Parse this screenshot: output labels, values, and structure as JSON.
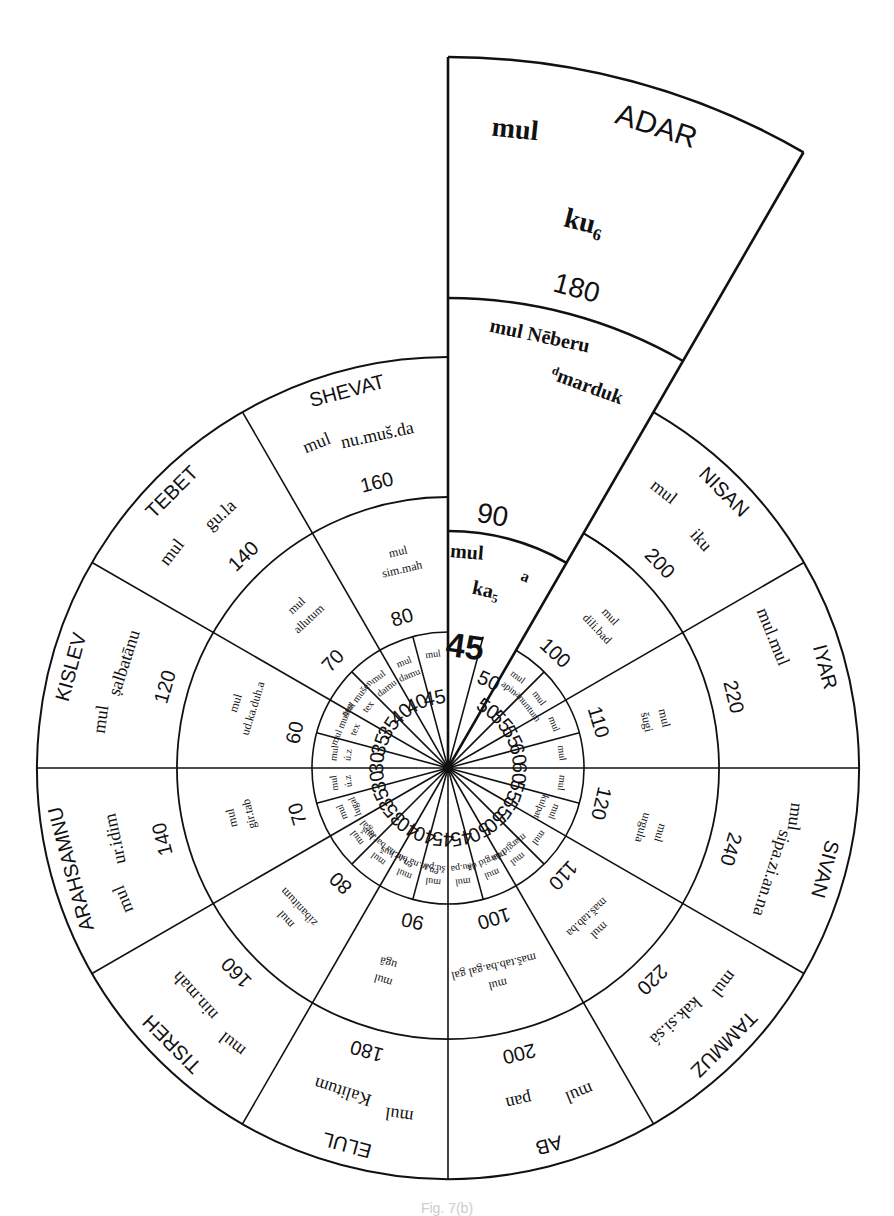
{
  "figure": {
    "center": [
      448,
      768
    ],
    "radii": {
      "inner": 136,
      "middle": 271,
      "outer": 411
    },
    "adar_extension": {
      "arc_90_radius": 237,
      "arc_neberu_radius": 470,
      "arc_outer_radius": 711,
      "label_90": "90"
    },
    "line_color": "#111111",
    "background": "#ffffff"
  },
  "months": [
    {
      "name": "ADAR",
      "start": 0,
      "outer": {
        "mul": "mul",
        "star": "ku₆",
        "value": "180"
      },
      "middle": {
        "mul": "mul Nēberu",
        "star": "ᵈmarduk",
        "value": "90"
      },
      "inner": [
        {
          "mul": "mul",
          "star": "ka₅",
          "value": "45"
        },
        {
          "mul": "a",
          "star": "",
          "value": "50"
        }
      ]
    },
    {
      "name": "NISAN",
      "start": 30,
      "outer": {
        "mul": "mul",
        "star": "iku",
        "value": "200"
      },
      "middle": {
        "mul": "mul",
        "star": "dili.bad",
        "value": "100"
      },
      "inner": [
        {
          "mul": "mul",
          "star": "apin",
          "value": "50"
        },
        {
          "mul": "mul",
          "star": "anuntum",
          "value": "55"
        }
      ]
    },
    {
      "name": "IYAR",
      "start": 60,
      "outer": {
        "mul": "mul.mul",
        "star": "",
        "value": "220"
      },
      "middle": {
        "mul": "mul",
        "star": "šugi",
        "value": "110"
      },
      "inner": [
        {
          "mul": "mul",
          "star": "",
          "value": "55"
        },
        {
          "mul": "mul",
          "star": "",
          "value": "60"
        }
      ]
    },
    {
      "name": "SIVAN",
      "start": 90,
      "outer": {
        "mul": "mul",
        "star": "sipa.zi.an.na",
        "value": "240"
      },
      "middle": {
        "mul": "mul",
        "star": "urgula",
        "value": "120"
      },
      "inner": [
        {
          "mul": "mul",
          "star": "",
          "value": "60"
        },
        {
          "mul": "mul",
          "star": "kulpat",
          "value": "55"
        }
      ]
    },
    {
      "name": "TAMMUZ",
      "start": 120,
      "outer": {
        "mul": "mul",
        "star": "kak.si.sá",
        "value": "220"
      },
      "middle": {
        "mul": "mul",
        "star": "maš.tab.ba",
        "value": "110"
      },
      "inner": [
        {
          "mul": "mul",
          "star": "",
          "value": "55"
        },
        {
          "mul": "mul",
          "star": "margid da",
          "value": "50"
        }
      ]
    },
    {
      "name": "AB",
      "start": 150,
      "outer": {
        "mul": "mul",
        "star": "pan",
        "value": "200"
      },
      "middle": {
        "mul": "mul",
        "star": "maš.tab.ba.gal gal",
        "value": "100"
      },
      "inner": [
        {
          "mul": "mul",
          "star": "margid da",
          "value": "50"
        },
        {
          "mul": "mul",
          "star": "šu.pa",
          "value": "45"
        }
      ]
    },
    {
      "name": "ELUL",
      "start": 180,
      "outer": {
        "mul": "mul",
        "star": "Kalitum",
        "value": "180"
      },
      "middle": {
        "mul": "mul",
        "star": "ugā",
        "value": "90"
      },
      "inner": [
        {
          "mul": "mul",
          "star": "šu.pa",
          "value": "45"
        },
        {
          "mul": "mul",
          "star": "en.te.na bar.huš",
          "value": "40"
        }
      ]
    },
    {
      "name": "TISREH",
      "start": 210,
      "outer": {
        "mul": "mul",
        "star": "nin.mah",
        "value": "160"
      },
      "middle": {
        "mul": "mul",
        "star": "zibanitum",
        "value": "80"
      },
      "inner": [
        {
          "mul": "mul",
          "star": "en.te.na bar.huš",
          "value": "40"
        },
        {
          "mul": "mul",
          "star": "lugal",
          "value": "35"
        }
      ]
    },
    {
      "name": "ARAHSAMNU",
      "start": 240,
      "outer": {
        "mul": "mul",
        "star": "ur.idim",
        "value": "140"
      },
      "middle": {
        "mul": "mul",
        "star": "gir.tab",
        "value": "70"
      },
      "inner": [
        {
          "mul": "mul",
          "star": "lugal",
          "value": "35"
        },
        {
          "mul": "mul",
          "star": "ú.z",
          "value": "30"
        }
      ]
    },
    {
      "name": "KISLEV",
      "start": 270,
      "outer": {
        "mul": "mul",
        "star": "ṣalbatānu",
        "value": "120"
      },
      "middle": {
        "mul": "mul",
        "star": "ud.ka.duh.a",
        "value": "60"
      },
      "inner": [
        {
          "mul": "mul",
          "star": "ú.z",
          "value": "30"
        },
        {
          "mul": "mul mušen",
          "star": "tex",
          "value": "35"
        }
      ]
    },
    {
      "name": "TEBET",
      "start": 300,
      "outer": {
        "mul": "mul",
        "star": "gu.la",
        "value": "140"
      },
      "middle": {
        "mul": "mul",
        "star": "allutum",
        "value": "70"
      },
      "inner": [
        {
          "mul": "mul mušen",
          "star": "tex",
          "value": "35"
        },
        {
          "mul": "mul",
          "star": "damu",
          "value": "40"
        }
      ]
    },
    {
      "name": "SHEVAT",
      "start": 330,
      "outer": {
        "mul": "mul",
        "star": "nu.muš.da",
        "value": "160"
      },
      "middle": {
        "mul": "mul",
        "star": "sim.mah",
        "value": "80"
      },
      "inner": [
        {
          "mul": "mul",
          "star": "damu",
          "value": "40"
        },
        {
          "mul": "mul",
          "star": "",
          "value": "45"
        }
      ]
    }
  ],
  "caption": "Fig. 7(b)"
}
